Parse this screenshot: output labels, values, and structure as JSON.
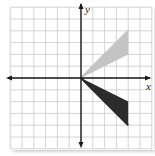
{
  "figure": {
    "type": "coordinate-plane",
    "axes": {
      "x_label": "x",
      "y_label": "y",
      "x_range": [
        -6,
        6
      ],
      "y_range": [
        -6,
        6
      ],
      "grid": true,
      "grid_step": 1
    },
    "shapes": [
      {
        "name": "light-triangle",
        "fill": "#c4c4c4",
        "segment": {
          "from": [
            0,
            0
          ],
          "to": [
            4,
            4
          ]
        },
        "vertices": [
          [
            0,
            0
          ],
          [
            4,
            4
          ],
          [
            4,
            2
          ]
        ]
      },
      {
        "name": "dark-triangle",
        "fill": "#2b2b2b",
        "segment": {
          "from": [
            0,
            0
          ],
          "to": [
            4,
            -4
          ]
        },
        "vertices": [
          [
            0,
            0
          ],
          [
            4,
            -4
          ],
          [
            4,
            -2
          ]
        ]
      }
    ],
    "colors": {
      "grid": "#c9c9c9",
      "axis": "#1a1a1a",
      "light_shape": "#c4c4c4",
      "dark_shape": "#2b2b2b"
    }
  }
}
